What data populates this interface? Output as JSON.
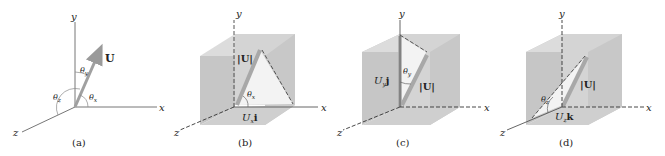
{
  "figure": {
    "panels": [
      {
        "id": "a",
        "caption": "(a)",
        "axes": {
          "x": "x",
          "y": "y",
          "z": "z"
        },
        "vector_label": "U",
        "angles": [
          "θx",
          "θy",
          "θz"
        ]
      },
      {
        "id": "b",
        "caption": "(b)",
        "axes": {
          "x": "x",
          "y": "y",
          "z": "z"
        },
        "magnitude_label": "|U|",
        "component_label": {
          "scalar": "U",
          "sub": "x",
          "unit": "i"
        },
        "angle": "θx"
      },
      {
        "id": "c",
        "caption": "(c)",
        "axes": {
          "x": "x",
          "y": "y",
          "z": "z"
        },
        "magnitude_label": "|U|",
        "component_label": {
          "scalar": "U",
          "sub": "y",
          "unit": "j"
        },
        "angle": "θy"
      },
      {
        "id": "d",
        "caption": "(d)",
        "axes": {
          "x": "x",
          "y": "y",
          "z": "z"
        },
        "magnitude_label": "|U|",
        "component_label": {
          "scalar": "U",
          "sub": "z",
          "unit": "k"
        },
        "angle": "θz"
      }
    ],
    "colors": {
      "axis": "#6b6b6b",
      "vector": "#9a9a9a",
      "box_front": "#c4c4c4",
      "box_side": "#d6d6d6",
      "box_top": "#dedede",
      "triangle": "#f2f2f2",
      "text": "#222222"
    }
  }
}
